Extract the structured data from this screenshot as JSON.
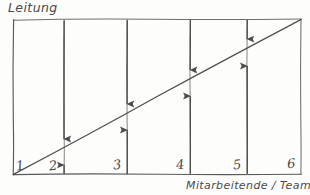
{
  "diagram": {
    "kind": "hand-drawn-line-diagram",
    "title_y": "Leitung",
    "title_x": "Mitarbeitende / Team",
    "ink_color": "#4a4a4a",
    "paper_color": "#fdfdfc",
    "axis_x": {
      "label": "Mitarbeitende / Team",
      "tick_labels": [
        "1",
        "2",
        "3",
        "4",
        "5",
        "6"
      ],
      "gridline_x": [
        13,
        64,
        127,
        190,
        247,
        300
      ]
    },
    "axis_y": {
      "label": "Leitung",
      "tick_labels": []
    },
    "trend_line": {
      "name": "diagonal-trend-line",
      "from": [
        13,
        174
      ],
      "to": [
        301,
        19
      ],
      "direction": "rising"
    },
    "frame": {
      "top_y": 19,
      "bottom_y": 174,
      "left_x": 13,
      "right_x": 301
    },
    "convergence_markers": [
      {
        "column": "2",
        "x": 64,
        "down_arrow_from_y": 19,
        "down_arrow_to_y": 146,
        "up_arrow_from_y": 174,
        "up_arrow_to_y": 157
      },
      {
        "column": "3",
        "x": 127,
        "down_arrow_from_y": 19,
        "down_arrow_to_y": 111,
        "up_arrow_from_y": 174,
        "up_arrow_to_y": 122
      },
      {
        "column": "4",
        "x": 190,
        "down_arrow_from_y": 19,
        "down_arrow_to_y": 77,
        "up_arrow_from_y": 174,
        "up_arrow_to_y": 88
      },
      {
        "column": "5",
        "x": 247,
        "down_arrow_from_y": 19,
        "down_arrow_to_y": 46,
        "up_arrow_from_y": 174,
        "up_arrow_to_y": 58
      }
    ],
    "tick_positions": [
      {
        "label": "1",
        "x": 16,
        "y": 158
      },
      {
        "label": "2",
        "x": 49,
        "y": 158
      },
      {
        "label": "3",
        "x": 113,
        "y": 157
      },
      {
        "label": "4",
        "x": 176,
        "y": 157
      },
      {
        "label": "5",
        "x": 233,
        "y": 157
      },
      {
        "label": "6",
        "x": 287,
        "y": 156
      }
    ]
  }
}
